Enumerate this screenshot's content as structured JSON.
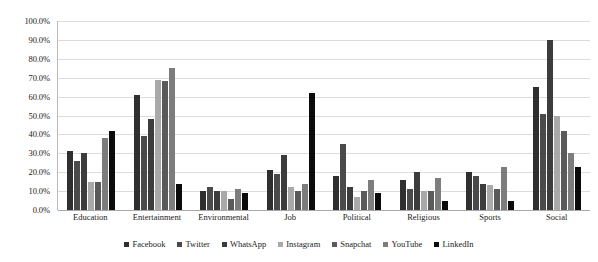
{
  "chart_data": {
    "type": "bar",
    "title": "",
    "xlabel": "",
    "ylabel": "",
    "ylim": [
      0,
      100
    ],
    "grid": true,
    "legend_position": "bottom",
    "categories": [
      "Education",
      "Entertainment",
      "Environmental",
      "Job",
      "Political",
      "Religious",
      "Sports",
      "Social"
    ],
    "ytick_labels": [
      "100.0%",
      "90.0%",
      "80.0%",
      "70.0%",
      "60.0%",
      "50.0%",
      "40.0%",
      "30.0%",
      "20.0%",
      "10.0%",
      "0.0%"
    ],
    "ytick_values": [
      100,
      90,
      80,
      70,
      60,
      50,
      40,
      30,
      20,
      10,
      0
    ],
    "series": [
      {
        "name": "Facebook",
        "color": "#2f2f2f",
        "values": [
          31,
          61,
          10,
          21,
          18,
          16,
          20,
          65
        ]
      },
      {
        "name": "Twitter",
        "color": "#4a4a4a",
        "values": [
          26,
          39,
          12,
          19,
          35,
          11,
          18,
          51
        ]
      },
      {
        "name": "WhatsApp",
        "color": "#3c3c3c",
        "values": [
          30,
          48,
          10,
          29,
          12,
          20,
          14,
          90
        ]
      },
      {
        "name": "Instagram",
        "color": "#a9a9a9",
        "values": [
          15,
          69,
          10,
          12,
          7,
          10,
          13,
          50
        ]
      },
      {
        "name": "Snapchat",
        "color": "#5a5a5a",
        "values": [
          15,
          68,
          6,
          10,
          10,
          10,
          11,
          42
        ]
      },
      {
        "name": "YouTube",
        "color": "#7d7d7d",
        "values": [
          38,
          75,
          11,
          14,
          16,
          17,
          23,
          30
        ]
      },
      {
        "name": "LinkedIn",
        "color": "#0b0b0b",
        "values": [
          42,
          14,
          9,
          62,
          9,
          5,
          5,
          23
        ]
      }
    ]
  }
}
